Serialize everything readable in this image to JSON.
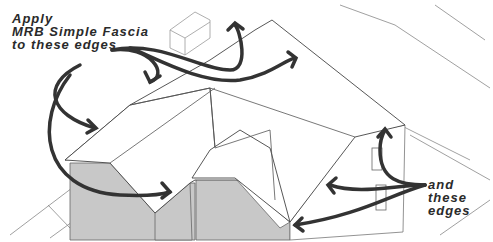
{
  "diagram": {
    "annotations": {
      "main_label_lines": [
        "Apply",
        "MRB Simple Fascia",
        "to these edges"
      ],
      "secondary_label_lines": [
        "and",
        "these",
        "edges"
      ]
    },
    "colors": {
      "arrow": "#333333",
      "wall_fill": "#c8c8c8",
      "roof_fill": "#ffffff",
      "line": "#555555",
      "text": "#2a2a2a"
    }
  }
}
